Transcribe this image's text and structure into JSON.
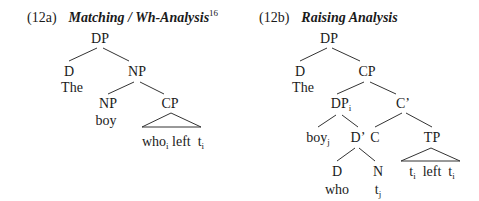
{
  "tree_a": {
    "number": "(12a)",
    "title": "Matching / Wh-Analysis",
    "footnote": "16",
    "nodes": {
      "root": "DP",
      "d": "D",
      "the": "The",
      "np": "NP",
      "np2": "NP",
      "boy": "boy",
      "cp": "CP",
      "yield_who": "who",
      "yield_who_sub": "i",
      "yield_left": "left",
      "yield_t": "t",
      "yield_t_sub": "i"
    }
  },
  "tree_b": {
    "number": "(12b)",
    "title": "Raising Analysis",
    "nodes": {
      "root": "DP",
      "d": "D",
      "the": "The",
      "cp": "CP",
      "dp": "DP",
      "dp_sub": "i",
      "cbar": "C’",
      "boy": "boy",
      "boy_sub": "j",
      "dbar": "D’",
      "c": "C",
      "tp": "TP",
      "d2": "D",
      "who": "who",
      "n": "N",
      "t": "t",
      "t_sub": "j",
      "yield_t1": "t",
      "yield_t1_sub": "i",
      "yield_left": "left",
      "yield_t2": "t",
      "yield_t2_sub": "i"
    }
  }
}
